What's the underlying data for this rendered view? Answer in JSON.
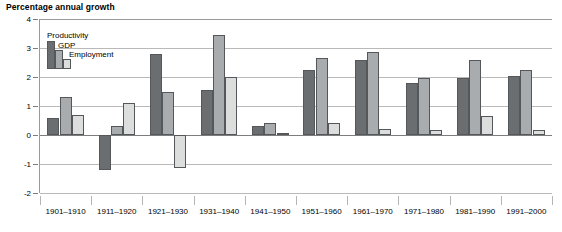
{
  "chart_data": {
    "type": "bar",
    "title": "Percentage annual growth",
    "xlabel": "",
    "ylabel": "",
    "ylim": [
      -2,
      4
    ],
    "yticks": [
      4,
      3,
      2,
      1,
      0,
      -1,
      -2
    ],
    "ytick_labels": [
      "4",
      "3",
      "2",
      "1",
      "0",
      "-1",
      "-2"
    ],
    "grid": true,
    "legend_position": "top-left inside plot",
    "categories": [
      "1901–1910",
      "1911–1920",
      "1921–1930",
      "1931–1940",
      "1941–1950",
      "1951–1960",
      "1961–1970",
      "1971–1980",
      "1981–1990",
      "1991–2000"
    ],
    "series": [
      {
        "name": "Productivity",
        "color": "#6b6e70",
        "values": [
          0.6,
          -1.2,
          2.8,
          1.55,
          0.3,
          2.25,
          2.6,
          1.8,
          1.95,
          2.05
        ]
      },
      {
        "name": "GDP",
        "color": "#a9acae",
        "values": [
          1.3,
          0.3,
          1.5,
          3.45,
          0.4,
          2.65,
          2.85,
          1.98,
          2.6,
          2.25
        ]
      },
      {
        "name": "Employment",
        "color": "#dcdedd",
        "values": [
          0.7,
          1.1,
          -1.15,
          2.0,
          0.08,
          0.4,
          0.2,
          0.18,
          0.65,
          0.18
        ]
      }
    ]
  }
}
